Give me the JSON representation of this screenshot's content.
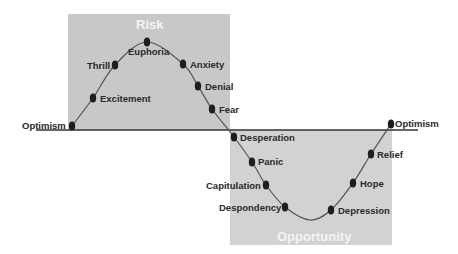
{
  "diagram": {
    "zones": {
      "risk": {
        "label": "Risk",
        "x": 68,
        "y": 14,
        "w": 162,
        "h": 116,
        "color": "#c8c8c8"
      },
      "opportunity": {
        "label": "Opportunity",
        "x": 230,
        "y": 130,
        "w": 162,
        "h": 115,
        "color": "#d2d2d2"
      }
    },
    "baseline": {
      "x1": 36,
      "x2": 418,
      "y": 130,
      "color": "#333333"
    },
    "curve_color": "#555555",
    "dot_color": "#1e1e1e",
    "points": [
      {
        "name": "Optimism",
        "x": 72,
        "y": 126,
        "label_x": 22,
        "label_y": 121
      },
      {
        "name": "Excitement",
        "x": 93,
        "y": 98,
        "label_x": 100,
        "label_y": 94
      },
      {
        "name": "Thrill",
        "x": 115,
        "y": 65,
        "label_x": 87,
        "label_y": 61
      },
      {
        "name": "Euphoria",
        "x": 147,
        "y": 42,
        "label_x": 128,
        "label_y": 47
      },
      {
        "name": "Anxiety",
        "x": 183,
        "y": 64,
        "label_x": 190,
        "label_y": 60
      },
      {
        "name": "Denial",
        "x": 198,
        "y": 86,
        "label_x": 205,
        "label_y": 82
      },
      {
        "name": "Fear",
        "x": 212,
        "y": 109,
        "label_x": 219,
        "label_y": 105
      },
      {
        "name": "Desperation",
        "x": 234,
        "y": 137,
        "label_x": 240,
        "label_y": 133
      },
      {
        "name": "Panic",
        "x": 252,
        "y": 162,
        "label_x": 258,
        "label_y": 157
      },
      {
        "name": "Capitulation",
        "x": 266,
        "y": 185,
        "label_x": 206,
        "label_y": 181
      },
      {
        "name": "Despondency",
        "x": 285,
        "y": 207,
        "label_x": 219,
        "label_y": 203
      },
      {
        "name": "Depression",
        "x": 331,
        "y": 210,
        "label_x": 338,
        "label_y": 206
      },
      {
        "name": "Hope",
        "x": 353,
        "y": 183,
        "label_x": 360,
        "label_y": 179
      },
      {
        "name": "Relief",
        "x": 371,
        "y": 154,
        "label_x": 377,
        "label_y": 150
      },
      {
        "name": "Optimism",
        "x": 391,
        "y": 124,
        "label_x": 395,
        "label_y": 119
      }
    ],
    "zone_title_positions": {
      "risk": {
        "x": 136,
        "y": 17
      },
      "opportunity": {
        "x": 277,
        "y": 229
      }
    }
  }
}
